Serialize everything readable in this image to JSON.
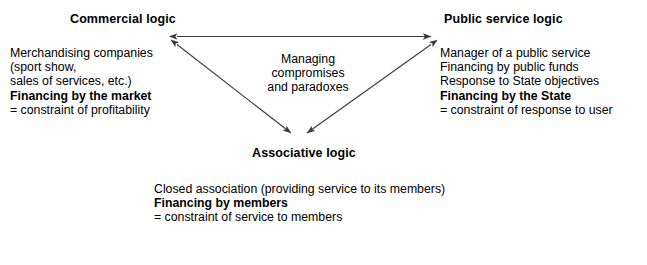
{
  "diagram": {
    "background_color": "#ffffff",
    "line_color": "#3a3a3a",
    "text_color": "#000000"
  },
  "nodes": {
    "commercial": {
      "title": "Commercial logic",
      "lines": [
        {
          "text": "Merchandising companies",
          "bold": false
        },
        {
          "text": "(sport show,",
          "bold": false
        },
        {
          "text": "sales of services, etc.)",
          "bold": false
        },
        {
          "text": "Financing by the market",
          "bold": true
        },
        {
          "text": "= constraint of profitability",
          "bold": false
        }
      ]
    },
    "public_service": {
      "title": "Public service logic",
      "lines": [
        {
          "text": "Manager of a public service",
          "bold": false
        },
        {
          "text": "Financing by public funds",
          "bold": false
        },
        {
          "text": "Response to State objectives",
          "bold": false
        },
        {
          "text": "Financing by the State",
          "bold": true
        },
        {
          "text": "= constraint of response to user",
          "bold": false
        }
      ]
    },
    "associative": {
      "title": "Associative logic",
      "lines": [
        {
          "text": "Closed association (providing service to its members)",
          "bold": false
        },
        {
          "text": "Financing by members",
          "bold": true
        },
        {
          "text": "= constraint of service to members",
          "bold": false
        }
      ]
    }
  },
  "center_note": {
    "lines": [
      "Managing",
      "compromises",
      "and paradoxes"
    ]
  },
  "connectors": [
    {
      "name": "commercial-public",
      "from": "Commercial logic",
      "to": "Public service logic",
      "style": "double-headed"
    },
    {
      "name": "commercial-associative",
      "from": "Commercial logic",
      "to": "Associative logic",
      "style": "double-headed"
    },
    {
      "name": "public-associative",
      "from": "Public service logic",
      "to": "Associative logic",
      "style": "double-headed"
    }
  ]
}
